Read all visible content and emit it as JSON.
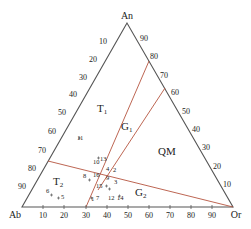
{
  "diagram": {
    "type": "ternary",
    "vertices": {
      "top": "An",
      "left": "Ab",
      "right": "Or"
    },
    "bottom_axis_ticks": [
      "10",
      "20",
      "30",
      "40",
      "50",
      "60",
      "70",
      "80",
      "90"
    ],
    "left_axis_ticks": [
      "10",
      "20",
      "30",
      "40",
      "50",
      "60",
      "70",
      "80",
      "90"
    ],
    "right_axis_ticks": [
      "90",
      "80",
      "70",
      "60",
      "50",
      "40",
      "30",
      "20",
      "10"
    ],
    "regions": {
      "T1": {
        "main": "T",
        "sub": "1"
      },
      "T2": {
        "main": "T",
        "sub": "2"
      },
      "G1": {
        "main": "G",
        "sub": "1"
      },
      "G2": {
        "main": "G",
        "sub": "2"
      },
      "QM": {
        "main": "QM",
        "sub": ""
      }
    },
    "points": [
      {
        "label": "1"
      },
      {
        "label": "2"
      },
      {
        "label": "3"
      },
      {
        "label": "4"
      },
      {
        "label": "5"
      },
      {
        "label": "6"
      },
      {
        "label": "7"
      },
      {
        "label": "8"
      },
      {
        "label": "9"
      },
      {
        "label": "10"
      },
      {
        "label": "11"
      },
      {
        "label": "12"
      },
      {
        "label": "13"
      },
      {
        "label": "14"
      },
      {
        "label": "15"
      },
      {
        "label": "16"
      }
    ],
    "line_color": "#555555",
    "boundary_color": "#b5553f"
  }
}
